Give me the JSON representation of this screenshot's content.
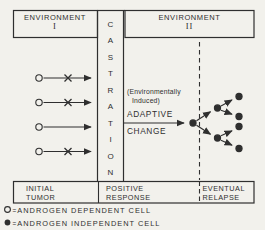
{
  "colors": {
    "background": "#f2f1ec",
    "ink": "#2f2f2f"
  },
  "environment1": {
    "title": "ENVIRONMENT",
    "numeral": "I"
  },
  "environment2": {
    "title": "ENVIRONMENT",
    "numeral": "II"
  },
  "castration": {
    "word": "CASTRATION",
    "letters": [
      "C",
      "A",
      "S",
      "T",
      "R",
      "A",
      "T",
      "I",
      "O",
      "N"
    ]
  },
  "adaptive_change": {
    "note_line1": "(Environmentally",
    "note_line2": "Induced)",
    "line1": "ADAPTIVE",
    "line2": "CHANGE"
  },
  "stages": {
    "initial": {
      "line1": "INITIAL",
      "line2": "TUMOR"
    },
    "positive": {
      "line1": "POSITIVE",
      "line2": "RESPONSE"
    },
    "eventual": {
      "line1": "EVENTUAL",
      "line2": "RELAPSE"
    }
  },
  "legend": {
    "dependent": {
      "eq": "=",
      "label": "ANDROGEN DEPENDENT CELL"
    },
    "independent": {
      "eq": "=",
      "label": "ANDROGEN INDEPENDENT CELL"
    }
  }
}
